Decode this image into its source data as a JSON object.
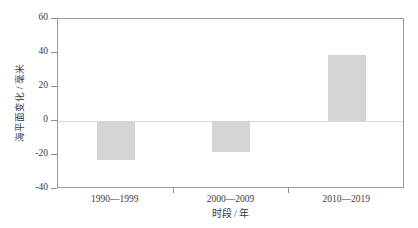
{
  "chart_data": {
    "type": "bar",
    "title": "",
    "subtitle": "",
    "xlabel": "时段 / 年",
    "ylabel": "海平面变化 / 毫米",
    "categories": [
      "1990—1999",
      "2000—2009",
      "2010—2019"
    ],
    "values": [
      -23,
      -18,
      39
    ],
    "series": [
      {
        "name": "海平面变化",
        "values": [
          -23,
          -18,
          39
        ]
      }
    ],
    "ylim": [
      -40,
      60
    ],
    "yticks": [
      -40,
      -20,
      0,
      20,
      40,
      60
    ],
    "ytick_labels": [
      "-40",
      "-20",
      "0",
      "20",
      "40",
      "60"
    ],
    "grid": false,
    "zero_line": true,
    "legend": "none",
    "bar_color": "#d5d5d5",
    "axis_color": "#9b9b9b",
    "text_color": "#3a3a3a"
  }
}
